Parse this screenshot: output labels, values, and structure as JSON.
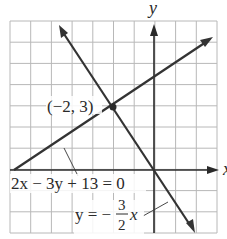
{
  "chart_data": {
    "type": "line",
    "title": "",
    "xlabel": "x",
    "ylabel": "y",
    "xlim": [
      -7,
      3
    ],
    "ylim": [
      -3,
      7
    ],
    "grid": true,
    "grid_step": 1,
    "tick_labels_shown": false,
    "series": [
      {
        "name": "2x - 3y + 13 = 0",
        "equation": "y = (2x + 13) / 3",
        "points": [
          [
            -6.5,
            0
          ],
          [
            3,
            6.33
          ]
        ]
      },
      {
        "name": "y = -3/2 x",
        "equation": "y = -1.5x",
        "points": [
          [
            -4.6,
            6.9
          ],
          [
            2,
            -3
          ]
        ]
      }
    ],
    "annotations": [
      {
        "text": "(-2, 3)",
        "x": -2,
        "y": 3,
        "type": "intersection-point"
      }
    ]
  },
  "labels": {
    "y_axis": "y",
    "x_axis": "x",
    "point": "(−2, 3)",
    "line1": "2x − 3y + 13 = 0",
    "line2_lhs": "y = −",
    "line2_num": "3",
    "line2_den": "2",
    "line2_var": "x"
  },
  "colors": {
    "grid": "#b8b8b8",
    "axis": "#2a2a2a",
    "line": "#333333"
  }
}
